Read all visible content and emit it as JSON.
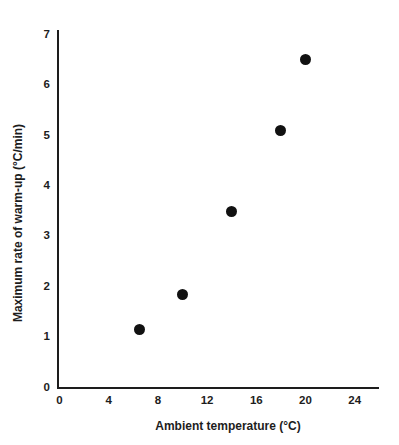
{
  "chart_data": {
    "type": "scatter",
    "title": "",
    "subtitle": "",
    "xlabel": "Ambient temperature (°C)",
    "ylabel": "Maximum rate of warm-up (°C/min)",
    "xlim": [
      0,
      26
    ],
    "ylim": [
      0,
      7.2
    ],
    "xticks": [
      0,
      4,
      8,
      12,
      16,
      20,
      24
    ],
    "xtick_labels": [
      "0",
      "4",
      "8",
      "12",
      "16",
      "20",
      "24"
    ],
    "yticks": [
      0,
      1,
      2,
      3,
      4,
      5,
      6,
      7
    ],
    "ytick_labels": [
      "0",
      "1",
      "2",
      "3",
      "4",
      "5",
      "6",
      "7"
    ],
    "grid": false,
    "legend": false,
    "legend_position": "none",
    "marker": "filled-circle",
    "marker_color": "#111111",
    "marker_size_px": 11,
    "axis_color": "#1d1d1d",
    "background_color": "#ffffff",
    "series": [
      {
        "name": "warm-up rate",
        "x": [
          6.5,
          10.0,
          14.0,
          18.0,
          20.0
        ],
        "y": [
          1.15,
          1.85,
          3.5,
          5.1,
          6.5
        ],
        "points": [
          {
            "x": 6.5,
            "y": 1.15
          },
          {
            "x": 10.0,
            "y": 1.85
          },
          {
            "x": 14.0,
            "y": 3.5
          },
          {
            "x": 18.0,
            "y": 5.1
          },
          {
            "x": 20.0,
            "y": 6.5
          }
        ]
      }
    ],
    "annotations": []
  }
}
